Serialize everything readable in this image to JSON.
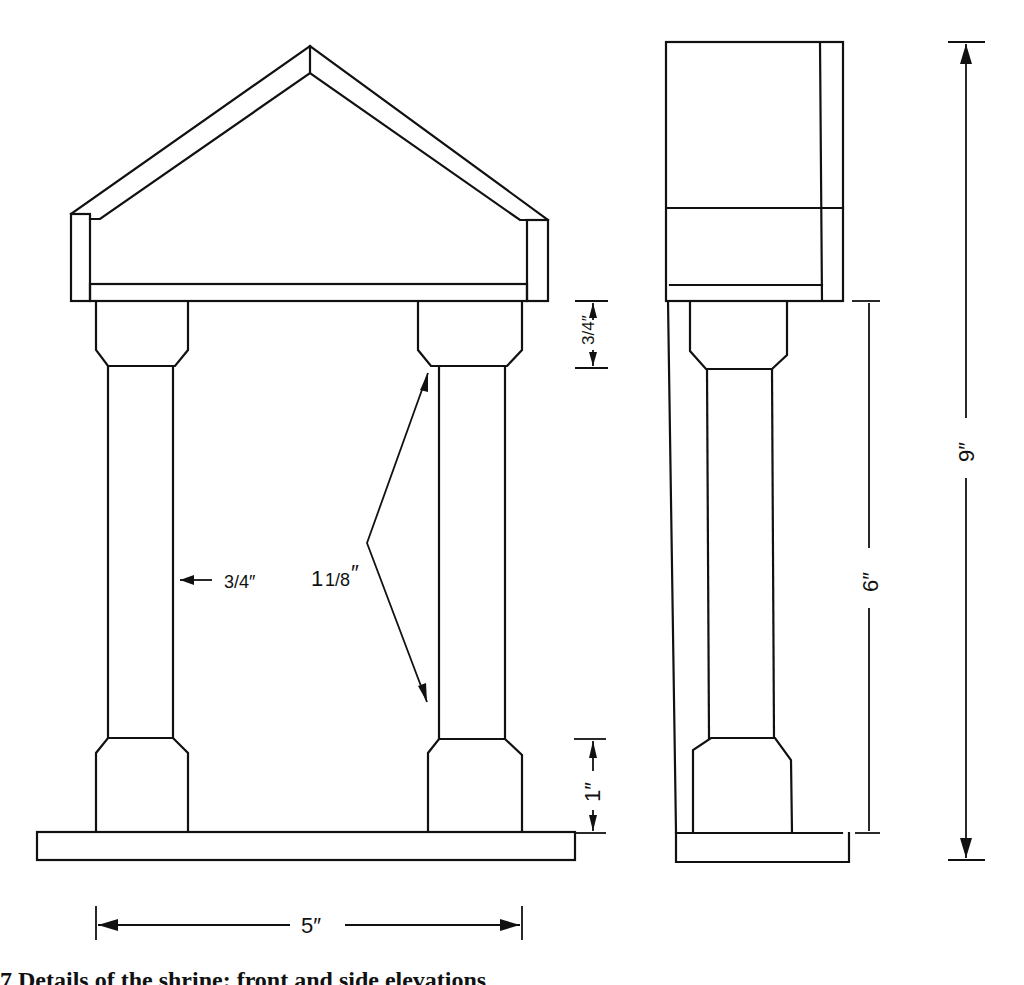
{
  "figure": {
    "caption": "7 Details of the shrine: front and side elevations",
    "views": [
      "front-elevation",
      "side-elevation"
    ]
  },
  "dimensions": {
    "overall_width": "5″",
    "overall_height": "9″",
    "column_height": "6″",
    "capital_height": "3/4″",
    "base_height": "1″",
    "column_shaft_width": "3/4″",
    "column_depth": "1 1/8″"
  },
  "labels": {
    "width_label": "5″",
    "height_label": "9″",
    "column_label": "6″",
    "capital_label": "3/4″",
    "base_label": "1″",
    "shaft_label": "3/4″",
    "depth_label_whole": "1",
    "depth_label_frac": "1/8",
    "depth_label_inch": "″"
  },
  "colors": {
    "ink": "#111111",
    "paper": "#ffffff"
  }
}
